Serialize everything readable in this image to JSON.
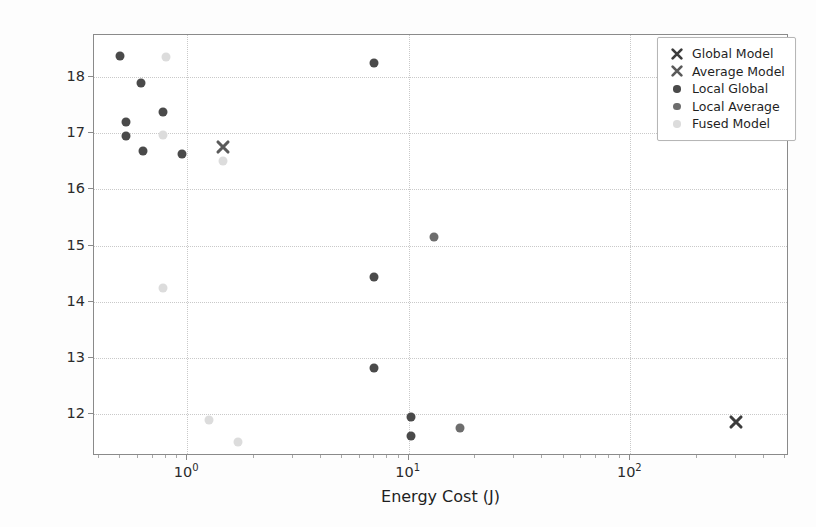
{
  "chart_data": {
    "type": "scatter",
    "title": "",
    "xlabel": "Energy Cost (J)",
    "ylabel": "Root Mean Square Error (RMSE)",
    "xscale": "log",
    "yscale": "linear",
    "xlim": [
      0.38,
      520
    ],
    "ylim": [
      11.25,
      18.75
    ],
    "xticks": [
      "10^0",
      "10^1",
      "10^2"
    ],
    "xtick_labels": [
      "10",
      "10",
      "10"
    ],
    "xtick_exponents": [
      "0",
      "1",
      "2"
    ],
    "yticks": [
      12,
      13,
      14,
      15,
      16,
      17,
      18
    ],
    "grid": true,
    "legend_position": "upper right",
    "series": [
      {
        "name": "Global Model",
        "marker": "X",
        "color": "#3c3c3c",
        "points": [
          [
            300,
            11.85
          ]
        ]
      },
      {
        "name": "Average Model",
        "marker": "X",
        "color": "#5a5a5a",
        "points": [
          [
            1.45,
            16.75
          ]
        ]
      },
      {
        "name": "Local Global",
        "marker": "o",
        "color": "#4a4a4a",
        "points": [
          [
            0.5,
            18.37
          ],
          [
            0.53,
            17.2
          ],
          [
            0.53,
            16.95
          ],
          [
            0.62,
            17.9
          ],
          [
            0.63,
            16.68
          ],
          [
            0.78,
            17.37
          ],
          [
            0.95,
            16.63
          ],
          [
            7.0,
            18.25
          ],
          [
            7.0,
            14.44
          ],
          [
            7.0,
            12.82
          ],
          [
            10.2,
            11.95
          ],
          [
            10.2,
            11.6
          ]
        ]
      },
      {
        "name": "Local Average",
        "marker": "o",
        "color": "#6d6d6d",
        "points": [
          [
            13.0,
            15.15
          ],
          [
            17.0,
            11.75
          ]
        ]
      },
      {
        "name": "Fused Model",
        "marker": "o",
        "color": "#dcdcdc",
        "points": [
          [
            0.8,
            18.35
          ],
          [
            0.78,
            16.97
          ],
          [
            0.78,
            14.25
          ],
          [
            1.45,
            16.5
          ],
          [
            1.25,
            11.9
          ],
          [
            1.7,
            11.5
          ]
        ]
      }
    ]
  },
  "legend": {
    "entries": [
      {
        "label": "Global Model",
        "marker": "x-marker-icon",
        "color": "#3c3c3c"
      },
      {
        "label": "Average Model",
        "marker": "x-marker-icon",
        "color": "#5a5a5a"
      },
      {
        "label": "Local Global",
        "marker": "dot-marker-icon",
        "color": "#4a4a4a"
      },
      {
        "label": "Local Average",
        "marker": "dot-marker-icon",
        "color": "#6d6d6d"
      },
      {
        "label": "Fused Model",
        "marker": "dot-marker-icon",
        "color": "#dcdcdc"
      }
    ]
  },
  "axes": {
    "x_label": "Energy Cost (J)",
    "y_label": "Root Mean Square Error (RMSE)"
  }
}
